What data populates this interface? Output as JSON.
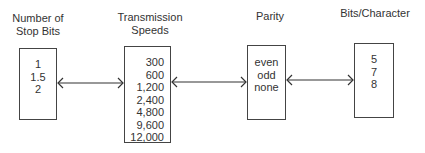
{
  "diagram": {
    "nodes": [
      {
        "id": "stop_bits",
        "label": "Number of Stop Bits",
        "label_lines": [
          "Number of",
          "Stop Bits"
        ],
        "values": [
          "1",
          "1.5",
          "2"
        ]
      },
      {
        "id": "transmission_speeds",
        "label": "Transmission Speeds",
        "label_lines": [
          "Transmission",
          "Speeds"
        ],
        "values": [
          "300",
          "600",
          "1,200",
          "2,400",
          "4,800",
          "9,600",
          "12,000"
        ]
      },
      {
        "id": "parity",
        "label": "Parity",
        "label_lines": [
          "Parity"
        ],
        "values": [
          "even",
          "odd",
          "none"
        ]
      },
      {
        "id": "bits_per_character",
        "label": "Bits/Character",
        "label_lines": [
          "Bits/Character"
        ],
        "values": [
          "5",
          "7",
          "8"
        ]
      }
    ],
    "edges": [
      {
        "from": "stop_bits",
        "to": "transmission_speeds",
        "type": "bidirectional"
      },
      {
        "from": "transmission_speeds",
        "to": "parity",
        "type": "bidirectional"
      },
      {
        "from": "parity",
        "to": "bits_per_character",
        "type": "bidirectional"
      }
    ]
  }
}
